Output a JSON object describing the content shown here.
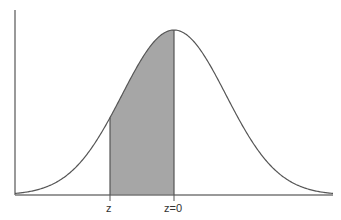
{
  "diagram": {
    "type": "normal-distribution-shaded-area",
    "labels": {
      "z_left": "z",
      "z_zero": "z=0"
    },
    "colors": {
      "curve": "#555555",
      "axis": "#777777",
      "shade": "#a6a6a6",
      "background": "#ffffff"
    },
    "geometry": {
      "origin_x": 15,
      "baseline_y": 195,
      "axis_top_y": 10,
      "axis_right_x": 333,
      "mean_x": 174,
      "peak_height": 165,
      "sigma_px": 52,
      "shade_from_x": 110,
      "shade_to_x": 174
    }
  }
}
